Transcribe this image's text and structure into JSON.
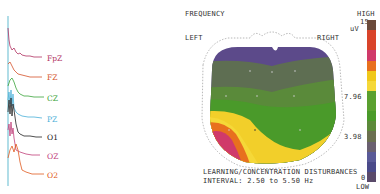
{
  "eeg": {
    "channels": [
      {
        "label": "FpZ",
        "color": "#b03060",
        "y": 58
      },
      {
        "label": "FZ",
        "color": "#d4522a",
        "y": 77
      },
      {
        "label": "CZ",
        "color": "#3aa33a",
        "y": 98
      },
      {
        "label": "PZ",
        "color": "#4ab0d8",
        "y": 119
      },
      {
        "label": "O1",
        "color": "#222222",
        "y": 137
      },
      {
        "label": "OZ",
        "color": "#c0407a",
        "y": 156
      },
      {
        "label": "O2",
        "color": "#e05a20",
        "y": 175
      }
    ],
    "axis_color": "#7cc6d8"
  },
  "map": {
    "title": "FREQUENCY",
    "left_label": "LEFT",
    "right_label": "RIGHT",
    "caption_line1": "LEARNING/CONCENTRATION DISTURBANCES",
    "caption_line2": "INTERVAL: 2.50 to 5.50 Hz"
  },
  "scale": {
    "high_label": "HIGH",
    "max_value": "15",
    "unit": "uV",
    "mid_high_value": "7.96",
    "mid_low_value": "3.98",
    "min_value": "0",
    "low_label": "LOW",
    "colors": [
      "#6b4a3a",
      "#d9442a",
      "#d9442a",
      "#d03a6a",
      "#e8701e",
      "#f0c81a",
      "#f5d838",
      "#5aa030",
      "#4a9a2a",
      "#5c8a3a",
      "#6a7050",
      "#6a6070",
      "#5a5a98",
      "#4a4a8a",
      "#5a4a6a"
    ]
  }
}
